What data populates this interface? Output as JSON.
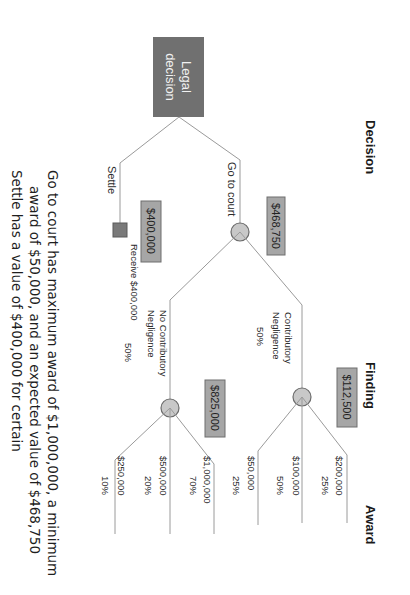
{
  "headers": {
    "decision": "Decision",
    "finding": "Finding",
    "award": "Award"
  },
  "root": {
    "label_line1": "Legal",
    "label_line2": "decision"
  },
  "branches": {
    "go_to_court": {
      "label": "Go to court",
      "expected_value": "$468,750"
    },
    "settle": {
      "label": "Settle",
      "expected_value": "$400,000",
      "outcome": "Receive $400,000"
    }
  },
  "findings": {
    "contributory": {
      "label_line1": "Contributory",
      "label_line2": "Negligence",
      "probability": "50%",
      "expected_value": "$112,500",
      "awards": [
        {
          "amount": "$200,000",
          "probability": "25%"
        },
        {
          "amount": "$100,000",
          "probability": "50%"
        },
        {
          "amount": "$50,000",
          "probability": "25%"
        }
      ]
    },
    "no_contributory": {
      "label_line1": "No Contributory",
      "label_line2": "Negligence",
      "probability": "50%",
      "expected_value": "$825,000",
      "awards": [
        {
          "amount": "$1,000,000",
          "probability": "70%"
        },
        {
          "amount": "$500,000",
          "probability": "20%"
        },
        {
          "amount": "$250,000",
          "probability": "10%"
        }
      ]
    }
  },
  "summary": {
    "line1": "Go to court has maximum award of $1,000,000, a minimum",
    "line2": "award of $50,000, and an expected value of $468,750",
    "line3": "Settle has a value of $400,000 for certain"
  },
  "colors": {
    "decision_node": "#707070",
    "chance_node": "#c8c8c8",
    "value_box": "#a6a6a6",
    "lines": "#9a9a9a"
  }
}
